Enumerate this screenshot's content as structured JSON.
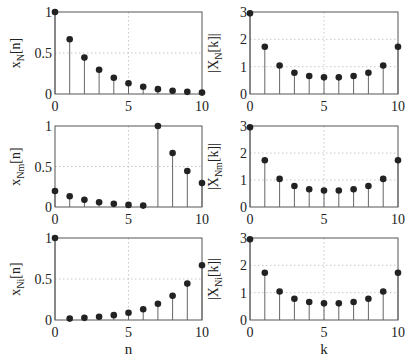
{
  "figure": {
    "width": 413,
    "height": 362,
    "colors": {
      "marker": "#222222",
      "stem": "#666666",
      "frame": "#555555",
      "grid": "#bbbbbb"
    }
  },
  "chart_data": [
    {
      "type": "stem",
      "id": "xN",
      "row": 0,
      "col": 0,
      "ylabel": "x_N[n]",
      "ylabel_main": "x",
      "ylabel_sub": "N",
      "ylabel_tail": "[n]",
      "xlabel": "",
      "x": [
        0,
        1,
        2,
        3,
        4,
        5,
        6,
        7,
        8,
        9,
        10
      ],
      "values": [
        1.0,
        0.667,
        0.444,
        0.296,
        0.198,
        0.132,
        0.088,
        0.059,
        0.039,
        0.026,
        0.017
      ],
      "xlim": [
        0,
        10
      ],
      "ylim": [
        0,
        1
      ],
      "xticks": [
        "0",
        "5",
        "10"
      ],
      "yticks": [
        "0",
        "0.5",
        "1"
      ],
      "grid": true
    },
    {
      "type": "stem",
      "id": "XN",
      "row": 0,
      "col": 1,
      "ylabel": "|X_N[k]|",
      "ylabel_main": "|X",
      "ylabel_sub": "N",
      "ylabel_tail": "[k]|",
      "xlabel": "",
      "x": [
        0,
        1,
        2,
        3,
        4,
        5,
        6,
        7,
        8,
        9,
        10
      ],
      "values": [
        2.95,
        1.73,
        1.04,
        0.78,
        0.66,
        0.61,
        0.61,
        0.66,
        0.78,
        1.04,
        1.73
      ],
      "xlim": [
        0,
        10
      ],
      "ylim": [
        0,
        3
      ],
      "xticks": [
        "0",
        "5",
        "10"
      ],
      "yticks": [
        "0",
        "1",
        "2",
        "3"
      ],
      "grid": true
    },
    {
      "type": "stem",
      "id": "xNm",
      "row": 1,
      "col": 0,
      "ylabel": "x_Nm[n]",
      "ylabel_main": "x",
      "ylabel_sub": "Nm",
      "ylabel_tail": "[n]",
      "xlabel": "",
      "x": [
        0,
        1,
        2,
        3,
        4,
        5,
        6,
        7,
        8,
        9,
        10
      ],
      "values": [
        0.198,
        0.132,
        0.088,
        0.059,
        0.039,
        0.026,
        0.017,
        1.0,
        0.667,
        0.444,
        0.296
      ],
      "xlim": [
        0,
        10
      ],
      "ylim": [
        0,
        1
      ],
      "xticks": [
        "0",
        "5",
        "10"
      ],
      "yticks": [
        "0",
        "0.5",
        "1"
      ],
      "grid": true
    },
    {
      "type": "stem",
      "id": "XNm",
      "row": 1,
      "col": 1,
      "ylabel": "|X_Nm[k]|",
      "ylabel_main": "|X",
      "ylabel_sub": "Nm",
      "ylabel_tail": "[k]|",
      "xlabel": "",
      "x": [
        0,
        1,
        2,
        3,
        4,
        5,
        6,
        7,
        8,
        9,
        10
      ],
      "values": [
        2.95,
        1.73,
        1.04,
        0.78,
        0.66,
        0.61,
        0.61,
        0.66,
        0.78,
        1.04,
        1.73
      ],
      "xlim": [
        0,
        10
      ],
      "ylim": [
        0,
        3
      ],
      "xticks": [
        "0",
        "5",
        "10"
      ],
      "yticks": [
        "0",
        "1",
        "2",
        "3"
      ],
      "grid": true
    },
    {
      "type": "stem",
      "id": "xNi",
      "row": 2,
      "col": 0,
      "ylabel": "x_Ni[n]",
      "ylabel_main": "x",
      "ylabel_sub": "Ni",
      "ylabel_tail": "[n]",
      "xlabel": "n",
      "x": [
        0,
        1,
        2,
        3,
        4,
        5,
        6,
        7,
        8,
        9,
        10
      ],
      "values": [
        1.0,
        0.017,
        0.026,
        0.039,
        0.059,
        0.088,
        0.132,
        0.198,
        0.296,
        0.444,
        0.667
      ],
      "xlim": [
        0,
        10
      ],
      "ylim": [
        0,
        1
      ],
      "xticks": [
        "0",
        "5",
        "10"
      ],
      "yticks": [
        "0",
        "0.5",
        "1"
      ],
      "grid": true
    },
    {
      "type": "stem",
      "id": "XNi",
      "row": 2,
      "col": 1,
      "ylabel": "|X_Ni[k]|",
      "ylabel_main": "|X",
      "ylabel_sub": "Ni",
      "ylabel_tail": "[k]|",
      "xlabel": "k",
      "x": [
        0,
        1,
        2,
        3,
        4,
        5,
        6,
        7,
        8,
        9,
        10
      ],
      "values": [
        2.95,
        1.73,
        1.04,
        0.78,
        0.66,
        0.61,
        0.61,
        0.66,
        0.78,
        1.04,
        1.73
      ],
      "xlim": [
        0,
        10
      ],
      "ylim": [
        0,
        3
      ],
      "xticks": [
        "0",
        "5",
        "10"
      ],
      "yticks": [
        "0",
        "1",
        "2",
        "3"
      ],
      "grid": true
    }
  ]
}
